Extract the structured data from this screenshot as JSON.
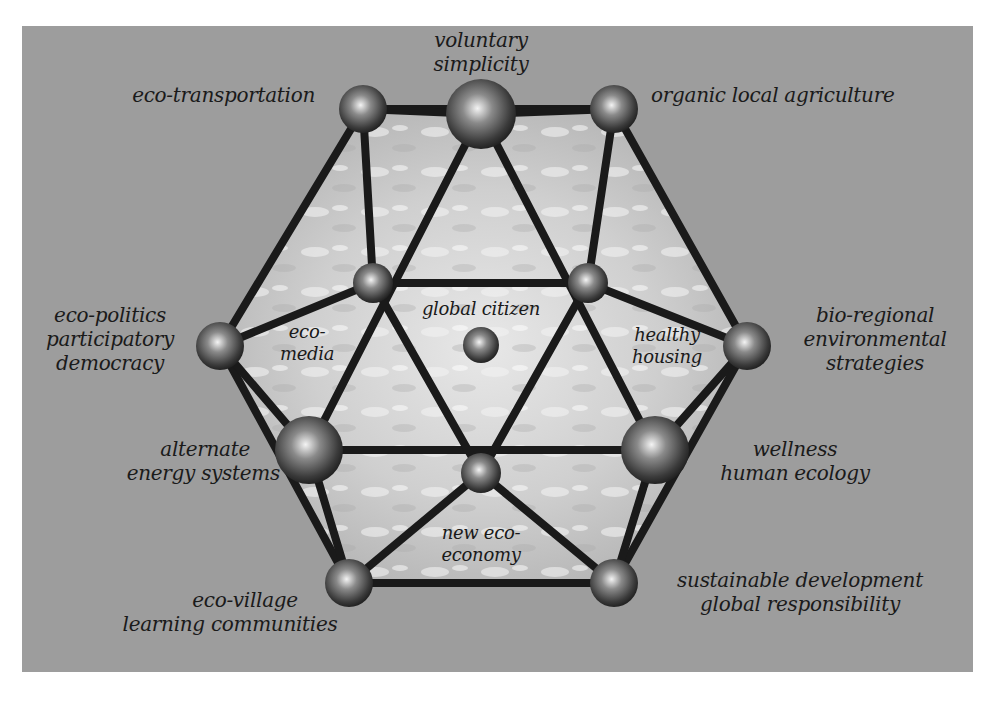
{
  "diagram": {
    "title": "",
    "center": "global citizen",
    "nodes": [
      {
        "id": "eco-transportation",
        "label": "eco-transportation"
      },
      {
        "id": "voluntary-simplicity",
        "label_lines": [
          "voluntary",
          "simplicity"
        ]
      },
      {
        "id": "organic-local-agriculture",
        "label": "organic local agriculture"
      },
      {
        "id": "eco-media",
        "label_lines": [
          "eco-",
          "media"
        ]
      },
      {
        "id": "healthy-housing",
        "label_lines": [
          "healthy",
          "housing"
        ]
      },
      {
        "id": "global-citizen",
        "label": "global citizen"
      },
      {
        "id": "eco-politics",
        "label_lines": [
          "eco-politics",
          "participatory",
          "democracy"
        ]
      },
      {
        "id": "bio-regional",
        "label_lines": [
          "bio-regional",
          "environmental",
          "strategies"
        ]
      },
      {
        "id": "alternate-energy",
        "label_lines": [
          "alternate",
          "energy systems"
        ]
      },
      {
        "id": "wellness",
        "label_lines": [
          "wellness",
          "human ecology"
        ]
      },
      {
        "id": "new-eco-economy",
        "label_lines": [
          "new eco-",
          "economy"
        ]
      },
      {
        "id": "eco-village",
        "label_lines": [
          "eco-village",
          "learning communities"
        ]
      },
      {
        "id": "sustainable-development",
        "label_lines": [
          "sustainable development",
          "global responsibility"
        ]
      }
    ],
    "colors": {
      "panel": "#9d9d9d",
      "edge": "#1a1a1a",
      "sphere_light": "#f4f4f4",
      "sphere_dark": "#1e1e1e",
      "text": "#1a1a1a"
    }
  }
}
